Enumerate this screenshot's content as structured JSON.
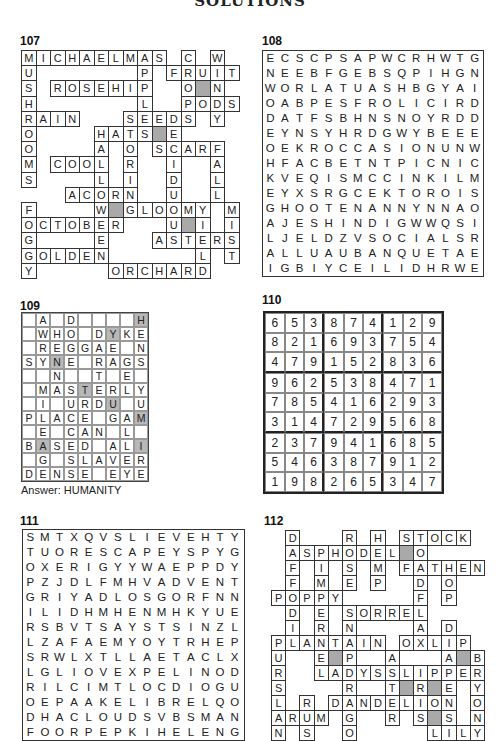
{
  "header": {
    "title": "SOLUTIONS"
  },
  "puzzles": {
    "p107": {
      "number": "107",
      "cols": 15,
      "rows": [
        "MICHAELMAS.C.W.",
        "U.......P.FRUIT",
        "S.ROSEHIP..O#N.",
        "H.......L..PODS",
        "RAIN...SEEDS.Y.",
        "O....HATS#E....",
        "O....A.O.SCARF.",
        "M.COOL.R..I..A.",
        "S....L.I..D..L.",
        "...ACORN..U..L.",
        "F....W#GLOOMY.M",
        "OCTOBER...U#I.I",
        "G....E...ASTERS",
        "GOLDEN......L.T",
        "Y.....ORCHARD.."
      ]
    },
    "p108": {
      "number": "108",
      "rows": [
        "ECSCPSAPWCRHWTG",
        "NEEBFGEBSQPIHGN",
        "WORLATUASHBGYAI",
        "OABPESFROLICIRD",
        "DATFSBHNSNOYRDD",
        "EYNSYHRDGWYBEEE",
        "OEKROCCASIONUNW",
        "HFACBETNTPICNIC",
        "KVEQISMCCINKILM",
        "EYXSRGCEKTOROIS",
        "GHOOTENANNYNNAO",
        "AJESHINDIGWWQSI",
        "LJELDZVSOCIALSR",
        "ALLUAUBANQUETAE",
        "IGBIYCEILIDHRWE"
      ]
    },
    "p109": {
      "number": "109",
      "rows": [
        ".A.D....H",
        ".WHO.DYKE",
        ".REGGAE.N",
        "SYNE.RAGS",
        "..N..T.E.",
        ".MASTERLY",
        ".I.URDU.U",
        "PLACE.GAM",
        ".E.CAN.L.",
        "BASED.ALI",
        ".G.SLAVER",
        "DENSE.EYE"
      ],
      "shaded": [
        [
          0,
          8
        ],
        [
          1,
          6
        ],
        [
          3,
          2
        ],
        [
          5,
          4
        ],
        [
          6,
          6
        ],
        [
          7,
          8
        ],
        [
          9,
          1
        ],
        [
          9,
          8
        ]
      ],
      "answer": "Answer: HUMANITY"
    },
    "p110": {
      "number": "110",
      "grid": [
        [
          6,
          5,
          3,
          8,
          7,
          4,
          1,
          2,
          9
        ],
        [
          8,
          2,
          1,
          6,
          9,
          3,
          7,
          5,
          4
        ],
        [
          4,
          7,
          9,
          1,
          5,
          2,
          8,
          3,
          6
        ],
        [
          9,
          6,
          2,
          5,
          3,
          8,
          4,
          7,
          1
        ],
        [
          7,
          8,
          5,
          4,
          1,
          6,
          2,
          9,
          3
        ],
        [
          3,
          1,
          4,
          7,
          2,
          9,
          5,
          6,
          8
        ],
        [
          2,
          3,
          7,
          9,
          4,
          1,
          6,
          8,
          5
        ],
        [
          5,
          4,
          6,
          3,
          8,
          7,
          9,
          1,
          2
        ],
        [
          1,
          9,
          8,
          2,
          6,
          5,
          3,
          4,
          7
        ]
      ]
    },
    "p111": {
      "number": "111",
      "rows": [
        "SMTXQVSLIEVEHTY",
        "TUORESCAPEYSPYG",
        "OXERIGYYWAEPPDY",
        "PZJDLFMHVADVENT",
        "GRIYADLOSGORFNN",
        "ILIDHMHENMHKYUE",
        "RSBVTSAYSTSINZL",
        "LZAFAEMYOYTRHEP",
        "SRWLXTLLAETACLX",
        "LGLIOVEXPELINOD",
        "RILCIMTLOCDIOGU",
        "OEPAAKELIBRELQO",
        "DHACLOUDSVBSMAN",
        "FOORPEPKIHELENG"
      ]
    },
    "p112": {
      "number": "112",
      "cols": 15,
      "rows": [
        ".D...R.H.STOCK.",
        ".ASPHODEL#O....",
        ".F.I.S.M.FATHEN",
        ".F.M.E.P..D.O..",
        "POPPY.....F.P..",
        ".D.E.SORREL....",
        ".I.R.N....A.D..",
        "PLANTAIN.OXLIP.",
        "U..E#P..A...A#B",
        "R..LADYSSLIPPER",
        "S....R..T#R#E.Y",
        "L.R.DANDELION.O",
        "ARUM.G..R.S#S.N",
        "N.S..O.....LILY"
      ]
    }
  }
}
